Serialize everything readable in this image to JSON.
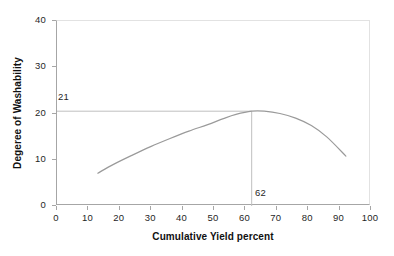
{
  "chart_data": {
    "type": "line",
    "title": "",
    "xlabel": "Cumulative Yield percent",
    "ylabel": "Degeree of  Washability",
    "xlim": [
      0,
      100
    ],
    "ylim": [
      0,
      40
    ],
    "xticks": [
      "0",
      "10",
      "20",
      "30",
      "40",
      "50",
      "60",
      "70",
      "80",
      "90",
      "100"
    ],
    "yticks": [
      "0",
      "10",
      "20",
      "30",
      "40"
    ],
    "grid": false,
    "legend": null,
    "series": [
      {
        "name": "Degree of Washability curve",
        "x": [
          13,
          18,
          24,
          30,
          36,
          42,
          48,
          53,
          57,
          62,
          66,
          71,
          76,
          81,
          86,
          92
        ],
        "values": [
          7.1,
          9.0,
          11.0,
          12.9,
          14.6,
          16.2,
          17.6,
          18.9,
          19.8,
          20.5,
          20.5,
          20.0,
          19.0,
          17.4,
          14.9,
          10.8
        ]
      }
    ],
    "annotations": [
      {
        "name": "peak-washability-value",
        "label": "21",
        "axis": "y",
        "value": 20.5,
        "line": "horizontal"
      },
      {
        "name": "optimum-yield-value",
        "label": "62",
        "axis": "x",
        "value": 62,
        "line": "vertical"
      }
    ],
    "colors": {
      "curve": "#9a9a9a",
      "axis": "#a6a6a6",
      "frame_light": "#e2e2e2",
      "annotation_line": "#bfbfbf",
      "text": "#1f1f1f",
      "background": "#ffffff"
    }
  }
}
